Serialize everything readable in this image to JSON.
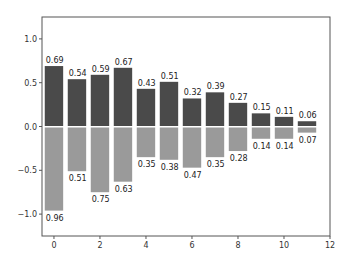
{
  "chart_data": {
    "type": "bar",
    "title": "",
    "xlabel": "",
    "ylabel": "",
    "xlim": [
      -0.52,
      12
    ],
    "ylim": [
      -1.25,
      1.25
    ],
    "grid": false,
    "legend": null,
    "x": [
      0,
      1,
      2,
      3,
      4,
      5,
      6,
      7,
      8,
      9,
      10,
      11
    ],
    "bar_width": 0.8,
    "series": [
      {
        "name": "positive",
        "color": "#4a4a4a",
        "values": [
          0.69,
          0.54,
          0.59,
          0.67,
          0.43,
          0.51,
          0.32,
          0.39,
          0.27,
          0.15,
          0.11,
          0.06
        ],
        "labels": [
          "0.69",
          "0.54",
          "0.59",
          "0.67",
          "0.43",
          "0.51",
          "0.32",
          "0.39",
          "0.27",
          "0.15",
          "0.11",
          "0.06"
        ]
      },
      {
        "name": "negative",
        "color": "#9a9a9a",
        "values": [
          -0.96,
          -0.51,
          -0.75,
          -0.63,
          -0.35,
          -0.38,
          -0.47,
          -0.35,
          -0.28,
          -0.14,
          -0.14,
          -0.07
        ],
        "labels": [
          "0.96",
          "0.51",
          "0.75",
          "0.63",
          "0.35",
          "0.38",
          "0.47",
          "0.35",
          "0.28",
          "0.14",
          "0.14",
          "0.07"
        ]
      }
    ],
    "xticks": [
      0,
      2,
      4,
      6,
      8,
      10,
      12
    ],
    "xtick_labels": [
      "0",
      "2",
      "4",
      "6",
      "8",
      "10",
      "12"
    ],
    "yticks": [
      1.0,
      0.5,
      0.0,
      -0.5,
      -1.0
    ],
    "ytick_labels": [
      "1.0",
      "0.5",
      "0.0",
      "−0.5",
      "−1.0"
    ]
  },
  "colors": {
    "axis": "#555555",
    "background": "#ffffff"
  }
}
